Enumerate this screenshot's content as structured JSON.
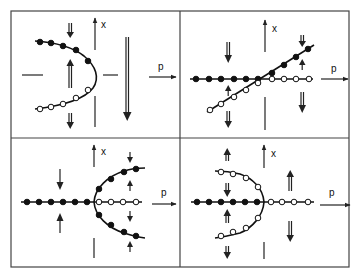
{
  "figure": {
    "layout": "2x2 grid of bifurcation diagrams",
    "axis_labels": {
      "horizontal": "p",
      "vertical": "x"
    },
    "legend": {
      "filled_dots": "stable branch",
      "open_dots": "unstable branch"
    },
    "panels": [
      {
        "id": "top-left",
        "type": "saddle-node (fold) bifurcation",
        "x_label": "x",
        "p_label": "p",
        "branches": [
          {
            "style": "filled",
            "description": "upper branch"
          },
          {
            "style": "open",
            "description": "lower branch"
          }
        ]
      },
      {
        "id": "top-right",
        "type": "transcritical bifurcation",
        "x_label": "x",
        "p_label": "p",
        "branches": [
          {
            "style": "filled",
            "description": "horizontal left, diagonal right"
          },
          {
            "style": "open",
            "description": "diagonal left, horizontal right"
          }
        ]
      },
      {
        "id": "bottom-left",
        "type": "supercritical pitchfork bifurcation",
        "x_label": "x",
        "p_label": "p",
        "branches": [
          {
            "style": "filled",
            "description": "trivial branch left, two outer branches right"
          },
          {
            "style": "open",
            "description": "trivial branch right"
          }
        ]
      },
      {
        "id": "bottom-right",
        "type": "subcritical pitchfork bifurcation",
        "x_label": "x",
        "p_label": "p",
        "branches": [
          {
            "style": "filled",
            "description": "trivial branch left"
          },
          {
            "style": "open",
            "description": "two outer branches left, trivial branch right"
          }
        ]
      }
    ]
  }
}
